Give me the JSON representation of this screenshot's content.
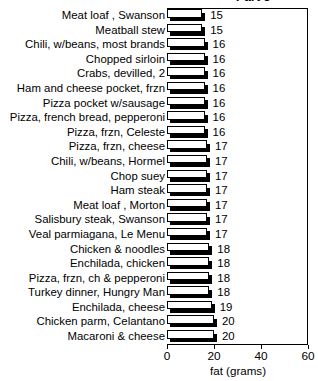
{
  "part_label": "Part 3",
  "axis": {
    "x_title": "fat (grams)",
    "x_ticks": [
      "0",
      "20",
      "40",
      "60"
    ]
  },
  "chart_data": {
    "type": "bar",
    "title": "Part 3",
    "orientation": "horizontal",
    "xlabel": "fat (grams)",
    "ylabel": "",
    "xlim": [
      0,
      60
    ],
    "xticks": [
      0,
      20,
      40,
      60
    ],
    "grid": false,
    "legend": false,
    "value_labels": true,
    "categories": [
      "Meat loaf , Swanson",
      "Meatball stew",
      "Chili, w/beans, most brands",
      "Chopped sirloin",
      "Crabs, devilled, 2",
      "Ham and cheese pocket, frzn",
      "Pizza pocket w/sausage",
      "Pizza, french bread, pepperoni",
      "Pizza, frzn, Celeste",
      "Pizza, frzn, cheese",
      "Chili, w/beans, Hormel",
      "Chop suey",
      "Ham steak",
      "Meat loaf , Morton",
      "Salisbury steak, Swanson",
      "Veal parmiagana, Le Menu",
      "Chicken & noodles",
      "Enchilada, chicken",
      "Pizza, frzn, ch & pepperoni",
      "Turkey dinner, Hungry Man",
      "Enchilada, cheese",
      "Chicken parm, Celantano",
      "Macaroni & cheese"
    ],
    "values": [
      15,
      15,
      16,
      16,
      16,
      16,
      16,
      16,
      16,
      17,
      17,
      17,
      17,
      17,
      17,
      17,
      18,
      18,
      18,
      18,
      19,
      20,
      20
    ]
  }
}
